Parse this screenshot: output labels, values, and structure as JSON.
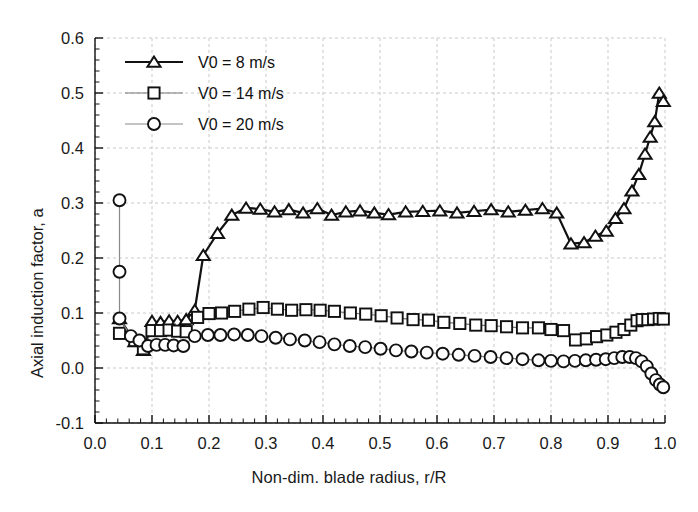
{
  "chart_data": {
    "type": "line",
    "title": "",
    "xlabel": "Non-dim. blade radius, r/R",
    "ylabel": "Axial induction factor, a",
    "xlim": [
      0.0,
      1.0
    ],
    "ylim": [
      -0.1,
      0.6
    ],
    "xticks": [
      "0.0",
      "0.1",
      "0.2",
      "0.3",
      "0.4",
      "0.5",
      "0.6",
      "0.7",
      "0.8",
      "0.9",
      "1.0"
    ],
    "yticks": [
      "-0.1",
      "0.0",
      "0.1",
      "0.2",
      "0.3",
      "0.4",
      "0.5",
      "0.6"
    ],
    "xtick_values": [
      0.0,
      0.1,
      0.2,
      0.3,
      0.4,
      0.5,
      0.6,
      0.7,
      0.8,
      0.9,
      1.0
    ],
    "ytick_values": [
      -0.1,
      0.0,
      0.1,
      0.2,
      0.3,
      0.4,
      0.5,
      0.6
    ],
    "grid": true,
    "minor_ticks": true,
    "legend_position": "upper-left",
    "series": [
      {
        "name": "V0 = 8 m/s",
        "marker": "triangle",
        "color": "#111111",
        "line_width": 2.0,
        "x": [
          0.043,
          0.07,
          0.085,
          0.1,
          0.115,
          0.13,
          0.145,
          0.16,
          0.175,
          0.19,
          0.215,
          0.24,
          0.265,
          0.29,
          0.315,
          0.34,
          0.365,
          0.39,
          0.415,
          0.44,
          0.465,
          0.49,
          0.515,
          0.545,
          0.575,
          0.605,
          0.635,
          0.665,
          0.695,
          0.725,
          0.755,
          0.785,
          0.81,
          0.835,
          0.858,
          0.878,
          0.897,
          0.913,
          0.928,
          0.942,
          0.954,
          0.965,
          0.974,
          0.982,
          0.99,
          0.997
        ],
        "y": [
          0.09,
          0.048,
          0.032,
          0.085,
          0.083,
          0.086,
          0.085,
          0.088,
          0.105,
          0.205,
          0.245,
          0.278,
          0.291,
          0.289,
          0.284,
          0.288,
          0.282,
          0.29,
          0.278,
          0.284,
          0.286,
          0.282,
          0.279,
          0.284,
          0.285,
          0.286,
          0.282,
          0.285,
          0.288,
          0.284,
          0.287,
          0.29,
          0.282,
          0.226,
          0.228,
          0.24,
          0.249,
          0.272,
          0.29,
          0.322,
          0.352,
          0.389,
          0.42,
          0.448,
          0.5,
          0.485
        ]
      },
      {
        "name": "V0 = 14 m/s",
        "marker": "square",
        "color": "#111111",
        "line_width": 1.2,
        "x": [
          0.043,
          0.07,
          0.085,
          0.1,
          0.115,
          0.13,
          0.145,
          0.16,
          0.18,
          0.2,
          0.222,
          0.245,
          0.27,
          0.295,
          0.32,
          0.345,
          0.37,
          0.395,
          0.42,
          0.448,
          0.475,
          0.502,
          0.53,
          0.558,
          0.585,
          0.612,
          0.64,
          0.668,
          0.695,
          0.722,
          0.75,
          0.778,
          0.8,
          0.822,
          0.843,
          0.862,
          0.88,
          0.898,
          0.914,
          0.928,
          0.94,
          0.951,
          0.96,
          0.97,
          0.98,
          0.99,
          0.997
        ],
        "y": [
          0.063,
          0.05,
          0.035,
          0.068,
          0.068,
          0.069,
          0.067,
          0.066,
          0.092,
          0.099,
          0.1,
          0.103,
          0.107,
          0.11,
          0.107,
          0.105,
          0.106,
          0.105,
          0.103,
          0.1,
          0.098,
          0.095,
          0.091,
          0.088,
          0.087,
          0.083,
          0.081,
          0.078,
          0.077,
          0.075,
          0.073,
          0.073,
          0.07,
          0.068,
          0.051,
          0.053,
          0.057,
          0.06,
          0.065,
          0.07,
          0.078,
          0.086,
          0.088,
          0.088,
          0.089,
          0.09,
          0.089
        ]
      },
      {
        "name": "V0 = 20 m/s",
        "marker": "circle",
        "color": "#111111",
        "line_width": 1.2,
        "x": [
          0.043,
          0.043,
          0.043,
          0.063,
          0.078,
          0.093,
          0.108,
          0.123,
          0.138,
          0.155,
          0.175,
          0.198,
          0.22,
          0.244,
          0.268,
          0.292,
          0.317,
          0.342,
          0.368,
          0.394,
          0.42,
          0.447,
          0.474,
          0.501,
          0.528,
          0.555,
          0.582,
          0.61,
          0.638,
          0.666,
          0.694,
          0.722,
          0.75,
          0.778,
          0.8,
          0.822,
          0.842,
          0.861,
          0.879,
          0.896,
          0.911,
          0.925,
          0.938,
          0.949,
          0.959,
          0.968,
          0.976,
          0.984,
          0.991,
          0.997
        ],
        "y": [
          0.305,
          0.175,
          0.09,
          0.058,
          0.05,
          0.04,
          0.042,
          0.042,
          0.041,
          0.04,
          0.058,
          0.06,
          0.06,
          0.061,
          0.06,
          0.058,
          0.055,
          0.052,
          0.05,
          0.047,
          0.043,
          0.04,
          0.038,
          0.035,
          0.032,
          0.03,
          0.028,
          0.026,
          0.024,
          0.022,
          0.02,
          0.018,
          0.016,
          0.014,
          0.013,
          0.012,
          0.013,
          0.014,
          0.015,
          0.016,
          0.018,
          0.02,
          0.02,
          0.018,
          0.012,
          0.003,
          -0.01,
          -0.022,
          -0.03,
          -0.035
        ]
      }
    ]
  },
  "legend": {
    "entries": [
      {
        "label": "V0 = 8 m/s",
        "marker": "triangle",
        "line_weight": "bold"
      },
      {
        "label": "V0 = 14 m/s",
        "marker": "square",
        "line_weight": "medium"
      },
      {
        "label": "V0 = 20 m/s",
        "marker": "circle",
        "line_weight": "light"
      }
    ]
  },
  "axes": {
    "x_label": "Non-dim. blade radius, r/R",
    "y_label": "Axial induction factor, a"
  },
  "colors": {
    "foreground": "#111111",
    "grid": "#c9c9c9",
    "background": "#ffffff"
  }
}
